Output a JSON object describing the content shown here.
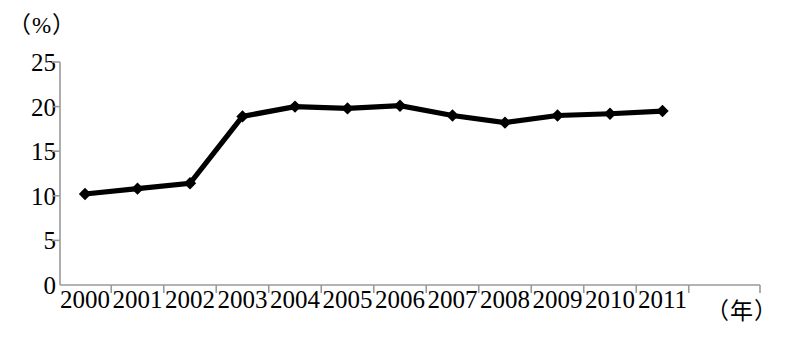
{
  "chart_data": {
    "type": "line",
    "title": "",
    "xlabel": "（年）",
    "ylabel": "（%）",
    "categories": [
      "2000",
      "2001",
      "2002",
      "2003",
      "2004",
      "2005",
      "2006",
      "2007",
      "2008",
      "2009",
      "2010",
      "2011"
    ],
    "values": [
      10.2,
      10.8,
      11.4,
      18.9,
      20.0,
      19.8,
      20.1,
      19.0,
      18.2,
      19.0,
      19.2,
      19.5
    ],
    "series": [
      {
        "name": "",
        "values": [
          10.2,
          10.8,
          11.4,
          18.9,
          20.0,
          19.8,
          20.1,
          19.0,
          18.2,
          19.0,
          19.2,
          19.5
        ]
      }
    ],
    "ylim": [
      0,
      25
    ],
    "yticks": [
      0,
      5,
      10,
      15,
      20,
      25
    ],
    "ytick_labels": [
      "0",
      "5",
      "10",
      "15",
      "20",
      "25"
    ],
    "grid": false,
    "legend": "none",
    "marker": "diamond",
    "line_color": "#000000",
    "axis_color": "#9a9a9a"
  },
  "axes": {
    "y_unit_label": "（%）",
    "x_unit_label": "（年）"
  }
}
